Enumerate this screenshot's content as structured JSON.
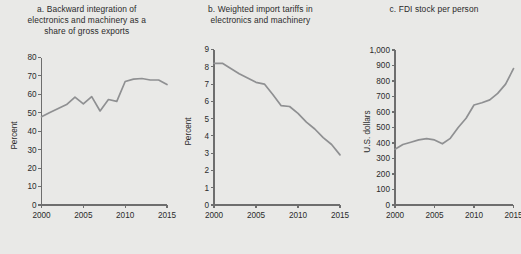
{
  "figure": {
    "background_color": "#e9e9e7",
    "line_color": "#8f9092",
    "axis_color": "#6e6e6e",
    "text_color": "#2b2b2b"
  },
  "panels": [
    {
      "key": "panel_a",
      "title": "a. Backward integration of\nelectronics and machinery as a\nshare of gross exports",
      "ylabel": "Percent"
    },
    {
      "key": "panel_b",
      "title": "b. Weighted import tariffs in\nelectronics and machinery",
      "ylabel": "Percent"
    },
    {
      "key": "panel_c",
      "title": "c. FDI stock per person",
      "ylabel": "U.S. dollars"
    }
  ],
  "chart_data": [
    {
      "type": "line",
      "title": "a. Backward integration of electronics and machinery as a share of gross exports",
      "xlabel": "",
      "ylabel": "Percent",
      "xlim": [
        2000,
        2015
      ],
      "ylim": [
        0,
        80
      ],
      "ytick_values": [
        0,
        10,
        20,
        30,
        40,
        50,
        60,
        70,
        80
      ],
      "ytick_labels": [
        "0",
        "10",
        "20",
        "30",
        "40",
        "50",
        "60",
        "70",
        "80"
      ],
      "xtick_values": [
        2000,
        2005,
        2010,
        2015
      ],
      "xtick_labels": [
        "2000",
        "2005",
        "2010",
        "2015"
      ],
      "grid": false,
      "legend": false,
      "x": [
        2000,
        2001,
        2002,
        2003,
        2004,
        2005,
        2006,
        2007,
        2008,
        2009,
        2010,
        2011,
        2012,
        2013,
        2014,
        2015
      ],
      "values": [
        47.8,
        50.2,
        52.3,
        54.5,
        58.5,
        54.8,
        58.8,
        51.0,
        57.2,
        56.2,
        67.0,
        68.3,
        68.6,
        67.8,
        67.8,
        65.3
      ]
    },
    {
      "type": "line",
      "title": "b. Weighted import tariffs in electronics and machinery",
      "xlabel": "",
      "ylabel": "Percent",
      "xlim": [
        2000,
        2015
      ],
      "ylim": [
        0,
        9
      ],
      "ytick_values": [
        0,
        1,
        2,
        3,
        4,
        5,
        6,
        7,
        8,
        9
      ],
      "ytick_labels": [
        "0",
        "1",
        "2",
        "3",
        "4",
        "5",
        "6",
        "7",
        "8",
        "9"
      ],
      "xtick_values": [
        2000,
        2005,
        2010,
        2015
      ],
      "xtick_labels": [
        "2000",
        "2005",
        "2010",
        "2015"
      ],
      "grid": false,
      "legend": false,
      "x": [
        2000,
        2001,
        2002,
        2003,
        2004,
        2005,
        2006,
        2007,
        2008,
        2009,
        2010,
        2011,
        2012,
        2013,
        2014,
        2015
      ],
      "values": [
        8.2,
        8.2,
        7.9,
        7.6,
        7.35,
        7.1,
        7.0,
        6.4,
        5.75,
        5.7,
        5.3,
        4.8,
        4.4,
        3.9,
        3.5,
        2.9
      ]
    },
    {
      "type": "line",
      "title": "c. FDI stock per person",
      "xlabel": "",
      "ylabel": "U.S. dollars",
      "xlim": [
        2000,
        2015
      ],
      "ylim": [
        0,
        1000
      ],
      "ytick_values": [
        0,
        100,
        200,
        300,
        400,
        500,
        600,
        700,
        800,
        900,
        1000
      ],
      "ytick_labels": [
        "0",
        "100",
        "200",
        "300",
        "400",
        "500",
        "600",
        "700",
        "800",
        "900",
        "1,000"
      ],
      "xtick_values": [
        2000,
        2005,
        2010,
        2015
      ],
      "xtick_labels": [
        "2000",
        "2005",
        "2010",
        "2015"
      ],
      "grid": false,
      "legend": false,
      "x": [
        2000,
        2001,
        2002,
        2003,
        2004,
        2005,
        2006,
        2007,
        2008,
        2009,
        2010,
        2011,
        2012,
        2013,
        2014,
        2015
      ],
      "values": [
        360,
        390,
        405,
        420,
        428,
        420,
        395,
        430,
        500,
        560,
        645,
        660,
        678,
        720,
        780,
        880
      ]
    }
  ]
}
